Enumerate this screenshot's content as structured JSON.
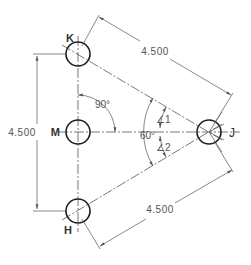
{
  "diagram": {
    "type": "bolt-hole pattern dimensioning",
    "holes": [
      {
        "label": "K",
        "cx": 78,
        "cy": 54
      },
      {
        "label": "M",
        "cx": 78,
        "cy": 132
      },
      {
        "label": "H",
        "cx": 78,
        "cy": 211
      },
      {
        "label": "J",
        "cx": 209,
        "cy": 132
      }
    ],
    "dimensions": {
      "top": "4.500",
      "left": "4.500",
      "bottom": "4.500"
    },
    "angles": {
      "right_angle": "90°",
      "included_angle": "60°",
      "angle1": "∠1",
      "angle2": "∠2"
    }
  }
}
